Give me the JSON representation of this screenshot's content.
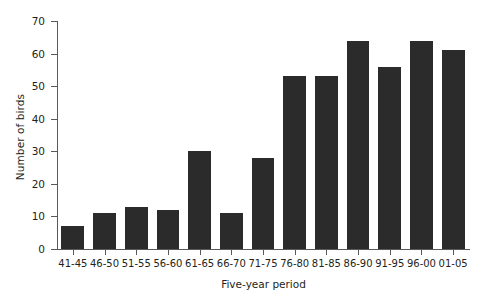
{
  "chart_data": {
    "type": "bar",
    "title": "",
    "xlabel": "Five-year period",
    "ylabel": "Number of birds",
    "categories": [
      "41-45",
      "46-50",
      "51-55",
      "56-60",
      "61-65",
      "66-70",
      "71-75",
      "76-80",
      "81-85",
      "86-90",
      "91-95",
      "96-00",
      "01-05"
    ],
    "values": [
      7,
      11,
      13,
      12,
      30,
      11,
      28,
      53,
      53,
      64,
      56,
      64,
      61
    ],
    "ylim": [
      0,
      70
    ],
    "ytick_labels": [
      "0",
      "10",
      "20",
      "30",
      "40",
      "50",
      "60",
      "70"
    ],
    "ytick_values": [
      0,
      10,
      20,
      30,
      40,
      50,
      60,
      70
    ],
    "grid": false,
    "legend": null,
    "bar_color": "#2b2b2b",
    "axis_color": "#58595b",
    "text_color": "#231f20",
    "background": "#ffffff"
  }
}
